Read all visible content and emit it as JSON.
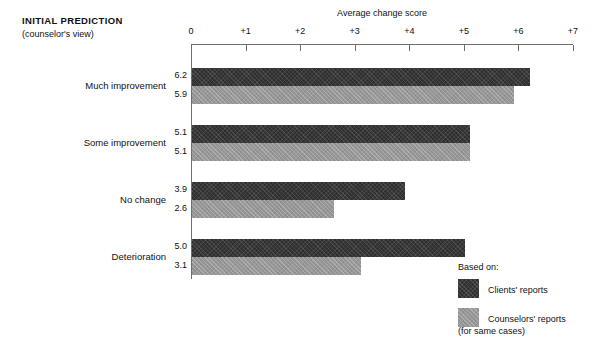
{
  "header": {
    "title": "INITIAL PREDICTION",
    "subtitle": "(counselor's view)"
  },
  "legend": {
    "title": "Based on:",
    "items": [
      {
        "label": "Clients' reports",
        "sublabel": "",
        "color": "#2f2f2f",
        "swatch": "dark"
      },
      {
        "label": "Counselors' reports",
        "sublabel": "(for same cases)",
        "color": "#979797",
        "swatch": "light"
      }
    ]
  },
  "chart_data": {
    "type": "bar",
    "orientation": "horizontal",
    "title": "",
    "xlabel": "Average change score",
    "ylabel": "",
    "xlim": [
      0,
      7
    ],
    "xticks": [
      0,
      1,
      2,
      3,
      4,
      5,
      6,
      7
    ],
    "xticklabels": [
      "0",
      "+1",
      "+2",
      "+3",
      "+4",
      "+5",
      "+6",
      "+7"
    ],
    "grid": false,
    "legend_position": "bottom-right",
    "categories": [
      "Much improvement",
      "Some improvement",
      "No change",
      "Deterioration"
    ],
    "series": [
      {
        "name": "Clients' reports",
        "color": "#2f2f2f",
        "values": [
          6.2,
          5.9,
          3.9,
          5.0
        ],
        "value_labels": [
          "6.2",
          "5.9",
          "3.9",
          "5.0"
        ]
      },
      {
        "name": "Counselors' reports (for same cases)",
        "color": "#979797",
        "values": [
          5.9,
          5.1,
          2.6,
          3.1
        ],
        "value_labels": [
          "5.9",
          "5.1",
          "2.6",
          "3.1"
        ]
      }
    ],
    "groups": [
      {
        "category": "Much improvement",
        "clients": 6.2,
        "counselors": 5.9,
        "clients_label": "6.2",
        "counselors_label": "5.9"
      },
      {
        "category": "Some improvement",
        "clients": 5.1,
        "counselors": 5.1,
        "clients_label": "5.1",
        "counselors_label": "5.1"
      },
      {
        "category": "No change",
        "clients": 3.9,
        "counselors": 2.6,
        "clients_label": "3.9",
        "counselors_label": "2.6"
      },
      {
        "category": "Deterioration",
        "clients": 5.0,
        "counselors": 3.1,
        "clients_label": "5.0",
        "counselors_label": "3.1"
      }
    ]
  }
}
